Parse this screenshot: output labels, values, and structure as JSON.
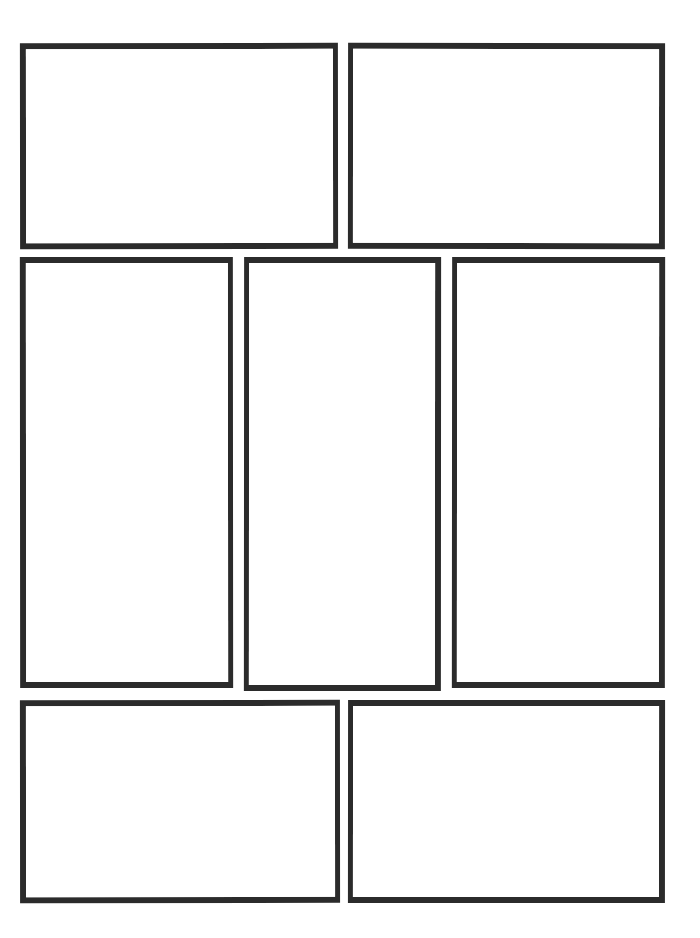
{
  "page": {
    "kind": "comic-page-layout-template",
    "title": "",
    "background_color": "#ffffff",
    "ink_color": "#2b2b2b",
    "width": 700,
    "height": 938,
    "page_number": "",
    "header_text": "",
    "footer_text": ""
  },
  "layout": {
    "row_count": 3,
    "panel_count": 7,
    "gutter_px": 11,
    "border_width_px": 6,
    "margin": {
      "top": 43,
      "right": 35,
      "bottom": 35,
      "left": 20
    }
  },
  "rows": [
    {
      "name": "row-1",
      "panels": [
        {
          "id": "panel-1",
          "label": "",
          "caption": "",
          "dialogue": "",
          "x": 20,
          "y": 43,
          "w": 318,
          "h": 206
        },
        {
          "id": "panel-2",
          "label": "",
          "caption": "",
          "dialogue": "",
          "x": 348,
          "y": 43,
          "w": 317,
          "h": 206
        }
      ]
    },
    {
      "name": "row-2",
      "panels": [
        {
          "id": "panel-3",
          "label": "",
          "caption": "",
          "dialogue": "",
          "x": 20,
          "y": 257,
          "w": 213,
          "h": 431
        },
        {
          "id": "panel-4",
          "label": "",
          "caption": "",
          "dialogue": "",
          "x": 244,
          "y": 257,
          "w": 197,
          "h": 434
        },
        {
          "id": "panel-5",
          "label": "",
          "caption": "",
          "dialogue": "",
          "x": 452,
          "y": 257,
          "w": 213,
          "h": 431
        }
      ]
    },
    {
      "name": "row-3",
      "panels": [
        {
          "id": "panel-6",
          "label": "",
          "caption": "",
          "dialogue": "",
          "x": 20,
          "y": 700,
          "w": 320,
          "h": 203
        },
        {
          "id": "panel-7",
          "label": "",
          "caption": "",
          "dialogue": "",
          "x": 348,
          "y": 700,
          "w": 317,
          "h": 203
        }
      ]
    }
  ]
}
